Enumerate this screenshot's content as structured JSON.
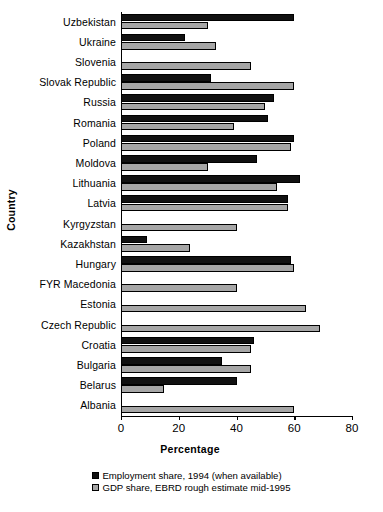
{
  "chart_data": {
    "type": "bar",
    "orientation": "horizontal",
    "title": "",
    "xlabel": "Percentage",
    "ylabel": "Country",
    "xlim": [
      0,
      80
    ],
    "xticks": [
      0,
      20,
      40,
      60,
      80
    ],
    "xtick_labels": [
      "0",
      "20",
      "40",
      "60",
      "80"
    ],
    "grid": false,
    "legend_position": "bottom-center",
    "categories": [
      "Uzbekistan",
      "Ukraine",
      "Slovenia",
      "Slovak Republic",
      "Russia",
      "Romania",
      "Poland",
      "Moldova",
      "Lithuania",
      "Latvia",
      "Kyrgyzstan",
      "Kazakhstan",
      "Hungary",
      "FYR Macedonia",
      "Estonia",
      "Czech Republic",
      "Croatia",
      "Bulgaria",
      "Belarus",
      "Albania"
    ],
    "series": [
      {
        "name": "Employment share, 1994 (when available)",
        "key": "employment",
        "color": "#111111",
        "values": [
          60,
          22,
          0,
          31,
          53,
          51,
          60,
          47,
          62,
          58,
          0,
          9,
          59,
          0,
          0,
          0,
          46,
          35,
          40,
          0
        ]
      },
      {
        "name": "GDP share, EBRD rough estimate mid-1995",
        "key": "gdp",
        "color": "#a6a6a6",
        "values": [
          30,
          33,
          45,
          60,
          50,
          39,
          59,
          30,
          54,
          58,
          40,
          24,
          60,
          40,
          64,
          69,
          45,
          45,
          15,
          60
        ]
      }
    ]
  },
  "legend": {
    "items": [
      {
        "label": "Employment share, 1994 (when available)",
        "swatch": "employment"
      },
      {
        "label": "GDP share, EBRD rough estimate mid-1995",
        "swatch": "gdp"
      }
    ]
  }
}
